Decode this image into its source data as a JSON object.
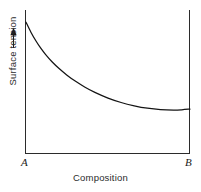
{
  "chart_data": {
    "type": "line",
    "title": "",
    "subtitle": "",
    "xlabel": "Composition",
    "ylabel": "Surface tension",
    "ylabel_arrow": "up-arrow",
    "grid": false,
    "legend": "none",
    "axis_endpoints": {
      "x_start_label": "A",
      "x_end_label": "B"
    },
    "xlim": [
      0,
      1
    ],
    "ylim": [
      0,
      1
    ],
    "x_tick_labels": [
      "A",
      "B"
    ],
    "y_tick_labels": [],
    "annotations": [],
    "series": [
      {
        "name": "Surface tension vs composition",
        "x": [
          0.0,
          0.03,
          0.06,
          0.09,
          0.12,
          0.16,
          0.2,
          0.25,
          0.3,
          0.36,
          0.42,
          0.5,
          0.58,
          0.66,
          0.74,
          0.82,
          0.9,
          0.95,
          1.0
        ],
        "y": [
          0.915,
          0.845,
          0.785,
          0.733,
          0.688,
          0.636,
          0.592,
          0.544,
          0.503,
          0.46,
          0.424,
          0.384,
          0.353,
          0.33,
          0.313,
          0.303,
          0.3,
          0.302,
          0.307
        ]
      }
    ]
  },
  "figure": {
    "xlabel": "Composition",
    "ylabel": "Surface tension",
    "endpoint_a": "A",
    "endpoint_b": "B"
  }
}
